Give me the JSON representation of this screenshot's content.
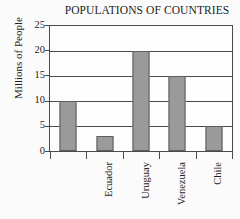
{
  "chart_data": {
    "type": "bar",
    "title": "POPULATIONS OF COUNTRIES",
    "xlabel": "",
    "ylabel": "Millions of People",
    "categories": [
      "Ecuador",
      "Uruguay",
      "Venezuela",
      "Chile",
      "Paraguay"
    ],
    "values": [
      10,
      3,
      20,
      15,
      5
    ],
    "ylim": [
      0,
      25
    ],
    "yticks": [
      0,
      5,
      10,
      15,
      20,
      25
    ],
    "ytick_labels": [
      "0",
      "5",
      "10",
      "15",
      "20",
      "25"
    ],
    "grid": true,
    "legend": null,
    "colors": {
      "bar_fill": "#9a9a9a",
      "bar_edge": "#5d5d5d",
      "axis": "#4a4a4a",
      "text": "#1d1d1d",
      "plot_background": "#fdfdfd",
      "page_background": "#fbfbfb"
    }
  }
}
